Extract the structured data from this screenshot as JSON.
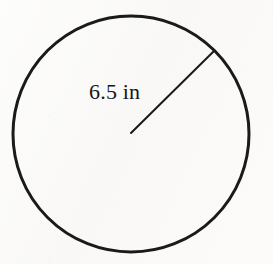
{
  "figure": {
    "kind": "geometry-diagram",
    "background_color": "#fbfaf8",
    "ink_color": "#1a1a1a",
    "label_color": "#161616",
    "canvas": {
      "width": 273,
      "height": 264
    },
    "circle": {
      "center_x": 131,
      "center_y": 134,
      "radius": 118,
      "stroke_width": 3,
      "fill": "none"
    },
    "radius_segment": {
      "label": "6.5 in",
      "value": 6.5,
      "unit": "in",
      "from_x": 131,
      "from_y": 133,
      "to_x": 214,
      "to_y": 51,
      "stroke_width": 2
    },
    "label": {
      "text": "6.5 in",
      "x": 89,
      "y": 80,
      "font_size": 22
    }
  }
}
